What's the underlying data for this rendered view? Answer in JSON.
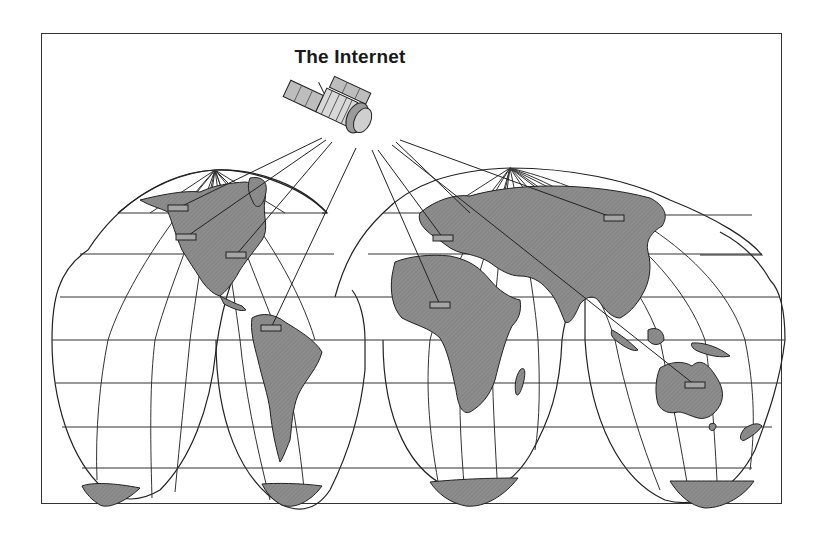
{
  "diagram": {
    "title": "The Internet",
    "type": "network-over-world-map",
    "projection": "interrupted world map (4 lobes)",
    "hub": {
      "name": "satellite",
      "icon": "satellite-icon",
      "x": 340,
      "y": 115
    },
    "nodes": [
      {
        "id": "alaska-canada",
        "region": "North America (north-west)",
        "x": 178,
        "y": 208
      },
      {
        "id": "western-north-america",
        "region": "North America (west)",
        "x": 186,
        "y": 237
      },
      {
        "id": "eastern-north-america",
        "region": "North America (east)",
        "x": 236,
        "y": 255
      },
      {
        "id": "south-america",
        "region": "South America",
        "x": 271,
        "y": 328
      },
      {
        "id": "europe",
        "region": "Europe",
        "x": 443,
        "y": 238
      },
      {
        "id": "africa",
        "region": "West Africa",
        "x": 440,
        "y": 305
      },
      {
        "id": "siberia",
        "region": "Northern Asia",
        "x": 614,
        "y": 218
      },
      {
        "id": "australia",
        "region": "Australia",
        "x": 695,
        "y": 385
      }
    ],
    "colors": {
      "land": "#8a8a8a",
      "outline": "#222222",
      "grid": "#333333",
      "node_fill": "#9a9a9a",
      "background": "#ffffff"
    }
  }
}
